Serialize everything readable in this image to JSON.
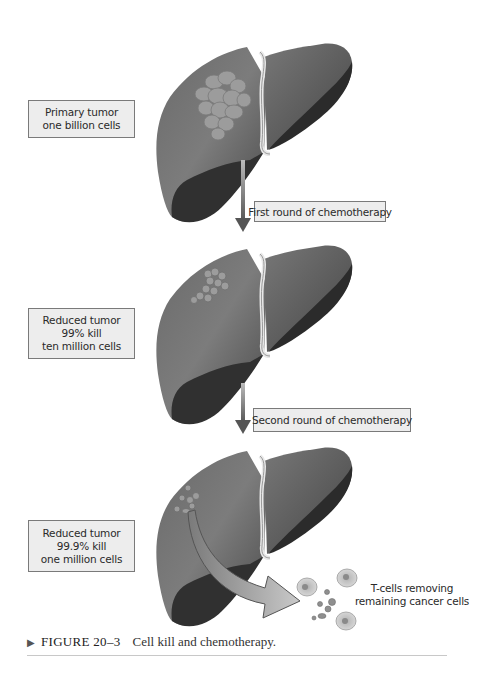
{
  "figure": {
    "caption_marker": "▶",
    "figure_number": "FIGURE 20–3",
    "caption_text": "Cell kill and chemotherapy."
  },
  "stages": [
    {
      "label_lines": [
        "Primary tumor",
        "one billion cells"
      ],
      "tumor_style": "large-cluster"
    },
    {
      "label_lines": [
        "Reduced tumor",
        "99% kill",
        "ten million cells"
      ],
      "tumor_style": "small-cluster"
    },
    {
      "label_lines": [
        "Reduced tumor",
        "99.9% kill",
        "one million cells"
      ],
      "tumor_style": "scattered-cells"
    }
  ],
  "transitions": [
    {
      "label": "First round of chemotherapy"
    },
    {
      "label": "Second round of chemotherapy"
    }
  ],
  "tcells": {
    "label_lines": [
      "T-cells removing",
      "remaining cancer cells"
    ]
  },
  "colors": {
    "liver_dark": "#3a3a3a",
    "liver_mid": "#5e5e5e",
    "liver_light": "#8a8a8a",
    "tumor": "#9a9a9a",
    "label_bg": "#ededed",
    "label_border": "#7a7a7a",
    "arrow": "#666666"
  }
}
